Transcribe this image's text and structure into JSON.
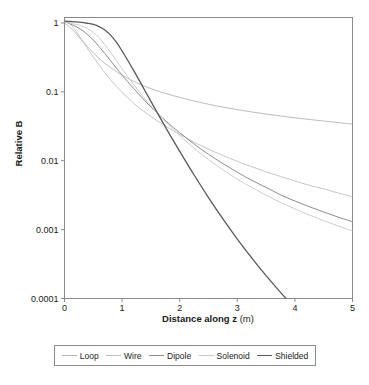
{
  "chart_data": {
    "type": "line",
    "title": "",
    "xlabel": "Distance along z (m)",
    "xlabel_bold_part": "Distance along z",
    "xlabel_unit_part": "(m)",
    "ylabel": "Relative B",
    "yscale": "log",
    "xscale": "linear",
    "xlim": [
      0,
      5
    ],
    "ylim": [
      0.0001,
      1.2
    ],
    "grid": false,
    "legend_position": "below-plot",
    "xticks": [
      "0",
      "1",
      "2",
      "3",
      "4",
      "5"
    ],
    "xtick_values": [
      0,
      1,
      2,
      3,
      4,
      5
    ],
    "yticks": [
      "1",
      "0.1",
      "0.01",
      "0.001",
      "0.0001"
    ],
    "ytick_values": [
      1,
      0.1,
      0.01,
      0.001,
      0.0001
    ],
    "x": [
      0,
      0.1,
      0.2,
      0.3,
      0.4,
      0.5,
      0.6,
      0.7,
      0.8,
      0.9,
      1.0,
      1.2,
      1.4,
      1.6,
      1.8,
      2.0,
      2.25,
      2.5,
      2.75,
      3.0,
      3.25,
      3.5,
      3.75,
      4.0,
      4.25,
      4.5,
      4.75,
      5.0
    ],
    "series": [
      {
        "name": "Loop",
        "color": "#b4b4b4",
        "width": 0.9,
        "values": [
          1.0,
          0.86,
          0.7,
          0.56,
          0.45,
          0.37,
          0.305,
          0.26,
          0.225,
          0.197,
          0.175,
          0.142,
          0.12,
          0.104,
          0.0925,
          0.083,
          0.0735,
          0.066,
          0.06,
          0.0552,
          0.0511,
          0.0476,
          0.0446,
          0.042,
          0.0397,
          0.0377,
          0.0358,
          0.034
        ]
      },
      {
        "name": "Wire",
        "color": "#c0c0c0",
        "width": 0.9,
        "values": [
          1.08,
          0.96,
          0.76,
          0.57,
          0.425,
          0.32,
          0.245,
          0.19,
          0.15,
          0.12,
          0.098,
          0.0685,
          0.0505,
          0.0385,
          0.0302,
          0.0242,
          0.0186,
          0.0147,
          0.0119,
          0.0098,
          0.0082,
          0.0069,
          0.0059,
          0.0051,
          0.0044,
          0.0039,
          0.0034,
          0.003
        ]
      },
      {
        "name": "Dipole",
        "color": "#8c8c8c",
        "width": 1.0,
        "values": [
          1.05,
          0.965,
          0.885,
          0.79,
          0.68,
          0.565,
          0.455,
          0.36,
          0.283,
          0.222,
          0.175,
          0.112,
          0.0735,
          0.05,
          0.0352,
          0.0255,
          0.0175,
          0.0124,
          0.0091,
          0.0068,
          0.0052,
          0.0041,
          0.0032,
          0.0026,
          0.00215,
          0.0018,
          0.00152,
          0.0013
        ]
      },
      {
        "name": "Solenoid",
        "color": "#c8c8c8",
        "width": 0.9,
        "values": [
          1.03,
          0.99,
          0.955,
          0.905,
          0.83,
          0.73,
          0.61,
          0.485,
          0.375,
          0.285,
          0.216,
          0.128,
          0.0785,
          0.0502,
          0.0335,
          0.0232,
          0.0152,
          0.0104,
          0.0074,
          0.0054,
          0.0041,
          0.00315,
          0.00248,
          0.002,
          0.00163,
          0.00135,
          0.00113,
          0.00096
        ]
      },
      {
        "name": "Shielded",
        "color": "#5a5a5a",
        "width": 1.3,
        "values": [
          1.06,
          1.05,
          1.04,
          1.02,
          0.99,
          0.95,
          0.885,
          0.79,
          0.665,
          0.525,
          0.392,
          0.205,
          0.103,
          0.0515,
          0.0262,
          0.0137,
          0.0062,
          0.00292,
          0.00143,
          0.00073,
          0.00039,
          0.000215,
          0.000123,
          7.25e-05,
          4.37e-05,
          2.7e-05,
          1.7e-05,
          1.09e-05
        ]
      }
    ]
  },
  "axes": {
    "ylabel": "Relative B",
    "xlabel_bold": "Distance along z",
    "xlabel_unit": "(m)",
    "ytick_labels": [
      "1",
      "0.1",
      "0.01",
      "0.001",
      "0.0001"
    ],
    "xtick_labels": [
      "0",
      "1",
      "2",
      "3",
      "4",
      "5"
    ],
    "frame_color": "#8a8a8a"
  },
  "legend": {
    "items": [
      {
        "label": "Loop",
        "color": "#b4b4b4",
        "width": "0.9px"
      },
      {
        "label": "Wire",
        "color": "#c0c0c0",
        "width": "0.9px"
      },
      {
        "label": "Dipole",
        "color": "#8c8c8c",
        "width": "1.0px"
      },
      {
        "label": "Solenoid",
        "color": "#c8c8c8",
        "width": "0.9px"
      },
      {
        "label": "Shielded",
        "color": "#5a5a5a",
        "width": "1.4px"
      }
    ],
    "border_color": "#8a8a8a"
  }
}
